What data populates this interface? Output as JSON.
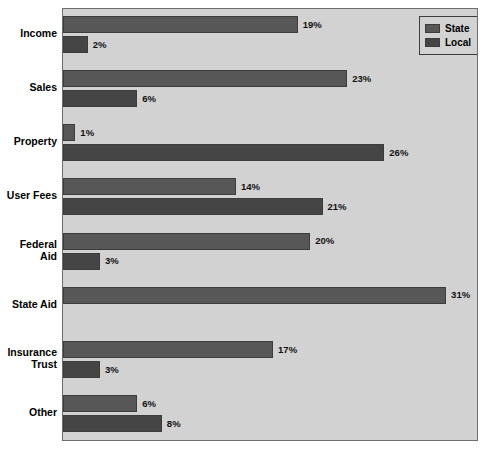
{
  "chart_data": {
    "type": "bar",
    "orientation": "horizontal",
    "title": "",
    "xlabel": "",
    "ylabel": "",
    "xlim": [
      0,
      33.5
    ],
    "grid": false,
    "legend_position": "top-right",
    "value_suffix": "%",
    "categories": [
      "Income",
      "Sales",
      "Property",
      "User Fees",
      "Federal Aid",
      "State Aid",
      "Insurance Trust",
      "Other"
    ],
    "series": [
      {
        "name": "State",
        "color": "#575757",
        "values": [
          19,
          23,
          1,
          14,
          20,
          31,
          17,
          6
        ],
        "labels": [
          "19%",
          "23%",
          "1%",
          "14%",
          "20%",
          "31%",
          "17%",
          "6%"
        ]
      },
      {
        "name": "Local",
        "color": "#454545",
        "values": [
          2,
          6,
          26,
          21,
          3,
          null,
          3,
          8
        ],
        "labels": [
          "2%",
          "6%",
          "26%",
          "21%",
          "3%",
          "",
          "3%",
          "8%"
        ]
      }
    ]
  },
  "categories_display": [
    {
      "lines": [
        "Income"
      ]
    },
    {
      "lines": [
        "Sales"
      ]
    },
    {
      "lines": [
        "Property"
      ]
    },
    {
      "lines": [
        "User Fees"
      ]
    },
    {
      "lines": [
        "Federal",
        "Aid"
      ]
    },
    {
      "lines": [
        "State Aid"
      ]
    },
    {
      "lines": [
        "Insurance",
        "Trust"
      ]
    },
    {
      "lines": [
        "Other"
      ]
    }
  ],
  "legend": {
    "items": [
      {
        "label": "State",
        "color": "#575757"
      },
      {
        "label": "Local",
        "color": "#454545"
      }
    ]
  },
  "style": {
    "plot_background": "#d2d2d2",
    "page_background": "#ffffff",
    "border_color": "#6e6e6e",
    "bar_border": "#3c3c3c",
    "text_color": "#000000"
  }
}
